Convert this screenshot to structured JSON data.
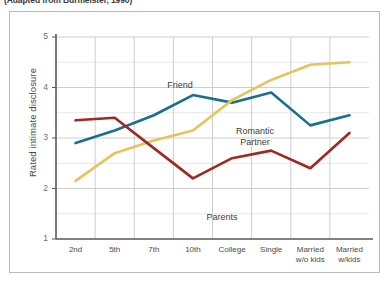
{
  "figure": {
    "source_note": "(Adapted from Burmeister, 1990)"
  },
  "chart_data": {
    "type": "line",
    "title": "",
    "xlabel": "",
    "ylabel": "Rated intimate disclosure",
    "categories": [
      "2nd",
      "5th",
      "7th",
      "10th",
      "College",
      "Single",
      "Married w/o kids",
      "Married w/kids"
    ],
    "category_lines": [
      [
        "2nd"
      ],
      [
        "5th"
      ],
      [
        "7th"
      ],
      [
        "10th"
      ],
      [
        "College"
      ],
      [
        "Single"
      ],
      [
        "Married",
        "w/o kids"
      ],
      [
        "Married",
        "w/kids"
      ]
    ],
    "ylim": [
      1,
      5
    ],
    "yticks": [
      1,
      2,
      3,
      4,
      5
    ],
    "ytick_labels": [
      "1",
      "2",
      "3",
      "4",
      "5"
    ],
    "grid": true,
    "grid_minor": true,
    "legend_position": "inline-annotations",
    "series": [
      {
        "name": "Friend",
        "color": "#1a6e8e",
        "values": [
          2.9,
          3.15,
          3.45,
          3.85,
          3.7,
          3.9,
          3.25,
          3.45
        ],
        "label": "Friend",
        "label_x": 170,
        "label_y": 68
      },
      {
        "name": "Romantic Partner",
        "color": "#e5c45e",
        "values": [
          2.15,
          2.7,
          2.95,
          3.15,
          3.75,
          4.15,
          4.45,
          4.5
        ],
        "label": "Romantic Partner",
        "label_lines": [
          "Romantic",
          "Partner"
        ],
        "label_x": 245,
        "label_y": 114
      },
      {
        "name": "Parents",
        "color": "#9c2a22",
        "values": [
          3.35,
          3.4,
          2.8,
          2.2,
          2.6,
          2.75,
          2.4,
          3.1
        ],
        "label": "Parents",
        "label_x": 212,
        "label_y": 200
      }
    ]
  }
}
